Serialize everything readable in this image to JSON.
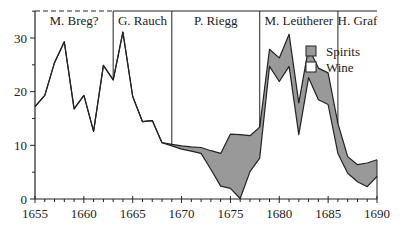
{
  "chart_data": {
    "type": "area",
    "title": "",
    "xlabel": "",
    "ylabel": "",
    "xlim": [
      1655,
      1690
    ],
    "ylim": [
      0,
      35
    ],
    "x_ticks": [
      1655,
      1660,
      1665,
      1670,
      1675,
      1680,
      1685,
      1690
    ],
    "x_tick_labels": [
      "1655",
      "1660",
      "1665",
      "1670",
      "1675",
      "1680",
      "1685",
      "1690"
    ],
    "y_ticks": [
      0,
      10,
      20,
      30
    ],
    "y_tick_labels": [
      "0",
      "10",
      "20",
      "30"
    ],
    "grid": false,
    "legend_position": "upper right",
    "x": [
      1655,
      1656,
      1657,
      1658,
      1659,
      1660,
      1661,
      1662,
      1663,
      1664,
      1665,
      1666,
      1667,
      1668,
      1669,
      1670,
      1671,
      1672,
      1673,
      1674,
      1675,
      1676,
      1677,
      1678,
      1679,
      1680,
      1681,
      1682,
      1683,
      1684,
      1685,
      1686,
      1687,
      1688,
      1689,
      1690
    ],
    "series": [
      {
        "name": "Wine",
        "color": "#ffffff",
        "values": [
          17.2,
          19.3,
          25.4,
          29.3,
          16.8,
          19.3,
          12.6,
          24.9,
          22.2,
          31.1,
          19.1,
          14.4,
          14.6,
          10.5,
          9.9,
          9.3,
          8.9,
          8.5,
          5.5,
          2.4,
          2.0,
          0.1,
          5.1,
          7.6,
          24.7,
          21.9,
          24.7,
          12.0,
          22.6,
          18.5,
          17.6,
          8.5,
          4.8,
          3.2,
          2.3,
          4.2
        ]
      },
      {
        "name": "Spirits",
        "color": "#999999",
        "values_total": [
          17.2,
          19.3,
          25.4,
          29.3,
          16.8,
          19.3,
          12.6,
          24.9,
          22.2,
          31.1,
          19.1,
          14.4,
          14.6,
          10.5,
          10.2,
          9.9,
          9.7,
          9.6,
          9.0,
          8.5,
          12.1,
          12.0,
          11.8,
          13.4,
          27.9,
          26.3,
          30.7,
          17.9,
          28.2,
          24.4,
          23.5,
          14.1,
          7.9,
          6.4,
          6.7,
          7.3
        ]
      }
    ],
    "periods": [
      {
        "label": "M. Breg?",
        "start": 1655,
        "end": 1663,
        "top_dashed": true
      },
      {
        "label": "G. Rauch",
        "start": 1663,
        "end": 1669,
        "top_dashed": false
      },
      {
        "label": "P. Riegg",
        "start": 1669,
        "end": 1678,
        "top_dashed": false
      },
      {
        "label": "M. Leütherer",
        "start": 1678,
        "end": 1686,
        "top_dashed": false
      },
      {
        "label": "H. Graf",
        "start": 1686,
        "end": 1690,
        "top_dashed": false
      }
    ],
    "legend": [
      {
        "label": "Spirits",
        "color": "#999999"
      },
      {
        "label": "Wine",
        "color": "#ffffff"
      }
    ]
  }
}
